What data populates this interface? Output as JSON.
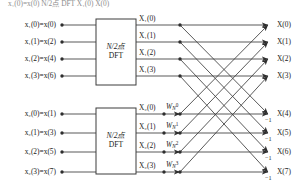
{
  "figure": {
    "type": "signal-flow-graph"
  },
  "blocks": [
    {
      "id": "dft-top",
      "line1": "N/2点",
      "line2": "DFT"
    },
    {
      "id": "dft-bottom",
      "line1": "N/2点",
      "line2": "DFT"
    }
  ],
  "inputs_top": [
    {
      "label": "x₁(0)=x(0)",
      "var": "x",
      "sub": "1",
      "index": "0",
      "maps_to": "x(0)"
    },
    {
      "label": "x₁(1)=x(2)",
      "var": "x",
      "sub": "1",
      "index": "1",
      "maps_to": "x(2)"
    },
    {
      "label": "x₁(2)=x(4)",
      "var": "x",
      "sub": "1",
      "index": "2",
      "maps_to": "x(4)"
    },
    {
      "label": "x₁(3)=x(6)",
      "var": "x",
      "sub": "1",
      "index": "3",
      "maps_to": "x(6)"
    }
  ],
  "inputs_bottom": [
    {
      "label": "x₂(0)=x(1)",
      "var": "x",
      "sub": "2",
      "index": "0",
      "maps_to": "x(1)"
    },
    {
      "label": "x₂(1)=x(3)",
      "var": "x",
      "sub": "2",
      "index": "1",
      "maps_to": "x(3)"
    },
    {
      "label": "x₂(2)=x(5)",
      "var": "x",
      "sub": "2",
      "index": "2",
      "maps_to": "x(5)"
    },
    {
      "label": "x₂(3)=x(7)",
      "var": "x",
      "sub": "2",
      "index": "3",
      "maps_to": "x(7)"
    }
  ],
  "mid_top": [
    {
      "label": "X₁(0)",
      "var": "X",
      "sub": "1",
      "index": "0"
    },
    {
      "label": "X₁(1)",
      "var": "X",
      "sub": "1",
      "index": "1"
    },
    {
      "label": "X₁(2)",
      "var": "X",
      "sub": "1",
      "index": "2"
    },
    {
      "label": "X₁(3)",
      "var": "X",
      "sub": "1",
      "index": "3"
    }
  ],
  "mid_bottom": [
    {
      "label": "X₂(0)",
      "var": "X",
      "sub": "2",
      "index": "0"
    },
    {
      "label": "X₂(1)",
      "var": "X",
      "sub": "2",
      "index": "1"
    },
    {
      "label": "X₂(2)",
      "var": "X",
      "sub": "2",
      "index": "2"
    },
    {
      "label": "X₂(3)",
      "var": "X",
      "sub": "2",
      "index": "3"
    }
  ],
  "twiddles": [
    {
      "label": "Wₙ⁰",
      "base": "W",
      "sub": "N",
      "sup": "0"
    },
    {
      "label": "Wₙ¹",
      "base": "W",
      "sub": "N",
      "sup": "1"
    },
    {
      "label": "Wₙ²",
      "base": "W",
      "sub": "N",
      "sup": "2"
    },
    {
      "label": "Wₙ³",
      "base": "W",
      "sub": "N",
      "sup": "3"
    }
  ],
  "outputs": [
    {
      "label": "X(0)",
      "sign": ""
    },
    {
      "label": "X(1)",
      "sign": ""
    },
    {
      "label": "X(2)",
      "sign": ""
    },
    {
      "label": "X(3)",
      "sign": ""
    },
    {
      "label": "X(4)",
      "sign": "−1"
    },
    {
      "label": "X(5)",
      "sign": "−1"
    },
    {
      "label": "X(6)",
      "sign": "−1"
    },
    {
      "label": "X(7)",
      "sign": "−1"
    }
  ],
  "negative_labels": [
    "−1",
    "−1",
    "−1",
    "−1"
  ],
  "colors": {
    "line": "#3c3c3c",
    "text": "#1a1a1a",
    "box_stroke": "#3c3c3c",
    "background": "#ffffff"
  },
  "cropped_text_top": "x₁(0)=x(0)   N/2点   DFT   X₁(0)   X(0)"
}
